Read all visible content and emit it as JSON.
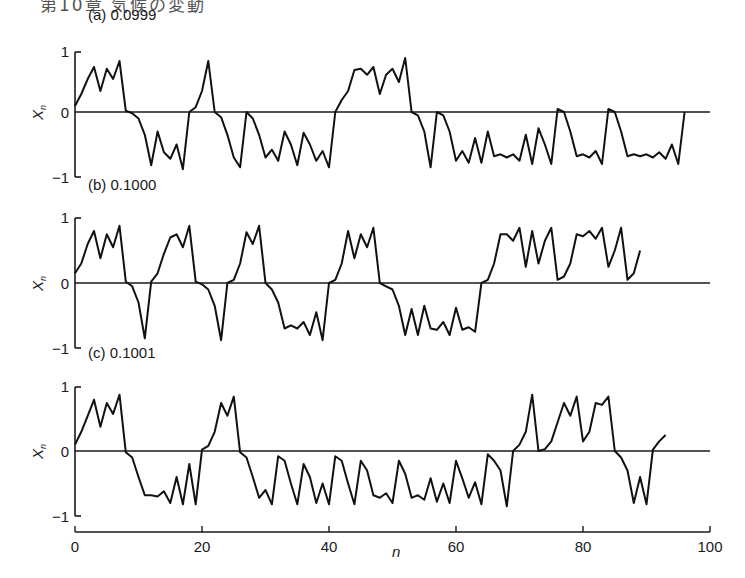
{
  "page_header": "第10章 気候の変動",
  "chart_data": [
    {
      "type": "line",
      "title": "(a) 0.0999",
      "panel_label": "(a)",
      "parameter": "0.0999",
      "xlabel": "n",
      "ylabel": "X_n",
      "xlim": [
        0,
        100
      ],
      "ylim": [
        -1,
        1
      ],
      "yticks": [
        "1",
        "0",
        "−1"
      ],
      "grid": false,
      "zero_line": true,
      "x": [
        0,
        1,
        2,
        3,
        4,
        5,
        6,
        7,
        8,
        9,
        10,
        11,
        12,
        13,
        14,
        15,
        16,
        17,
        18,
        19,
        20,
        21,
        22,
        23,
        24,
        25,
        26,
        27,
        28,
        29,
        30,
        31,
        32,
        33,
        34,
        35,
        36,
        37,
        38,
        39,
        40,
        41,
        42,
        43,
        44,
        45,
        46,
        47,
        48,
        49,
        50,
        51,
        52,
        53,
        54,
        55,
        56,
        57,
        58,
        59,
        60,
        61,
        62,
        63,
        64,
        65,
        66,
        67,
        68,
        69,
        70,
        71,
        72,
        73,
        74,
        75,
        76,
        77,
        78,
        79,
        80,
        81,
        82,
        83,
        84,
        85,
        86,
        87,
        88,
        89,
        90,
        91,
        92,
        93,
        94,
        95,
        96,
        97,
        98,
        99,
        100
      ],
      "values": [
        0.1,
        0.3,
        0.55,
        0.75,
        0.35,
        0.72,
        0.55,
        0.85,
        0.02,
        -0.02,
        -0.1,
        -0.35,
        -0.82,
        -0.3,
        -0.62,
        -0.72,
        -0.5,
        -0.88,
        0.0,
        0.08,
        0.35,
        0.85,
        0.0,
        -0.08,
        -0.35,
        -0.7,
        -0.85,
        0.0,
        -0.1,
        -0.35,
        -0.7,
        -0.58,
        -0.75,
        -0.3,
        -0.5,
        -0.82,
        -0.32,
        -0.5,
        -0.75,
        -0.6,
        -0.85,
        0.0,
        0.2,
        0.35,
        0.7,
        0.72,
        0.62,
        0.75,
        0.3,
        0.62,
        0.72,
        0.5,
        0.9,
        0.0,
        -0.05,
        -0.3,
        -0.85,
        0.0,
        -0.05,
        -0.3,
        -0.75,
        -0.6,
        -0.78,
        -0.4,
        -0.78,
        -0.3,
        -0.68,
        -0.65,
        -0.7,
        -0.65,
        -0.75,
        -0.35,
        -0.8,
        -0.25,
        -0.5,
        -0.8,
        0.05,
        0.0,
        -0.3,
        -0.68,
        -0.65,
        -0.7,
        -0.6,
        -0.8,
        0.05,
        0.0,
        -0.3,
        -0.68,
        -0.65,
        -0.68,
        -0.65,
        -0.7,
        -0.62,
        -0.72,
        -0.5,
        -0.8,
        0.0,
        null,
        null,
        null,
        null
      ]
    },
    {
      "type": "line",
      "title": "(b) 0.1000",
      "panel_label": "(b)",
      "parameter": "0.1000",
      "xlabel": "n",
      "ylabel": "X_n",
      "xlim": [
        0,
        100
      ],
      "ylim": [
        -1,
        1
      ],
      "yticks": [
        "1",
        "0",
        "−1"
      ],
      "grid": false,
      "zero_line": true,
      "x": [
        0,
        1,
        2,
        3,
        4,
        5,
        6,
        7,
        8,
        9,
        10,
        11,
        12,
        13,
        14,
        15,
        16,
        17,
        18,
        19,
        20,
        21,
        22,
        23,
        24,
        25,
        26,
        27,
        28,
        29,
        30,
        31,
        32,
        33,
        34,
        35,
        36,
        37,
        38,
        39,
        40,
        41,
        42,
        43,
        44,
        45,
        46,
        47,
        48,
        49,
        50,
        51,
        52,
        53,
        54,
        55,
        56,
        57,
        58,
        59,
        60,
        61,
        62,
        63,
        64,
        65,
        66,
        67,
        68,
        69,
        70,
        71,
        72,
        73,
        74,
        75,
        76,
        77,
        78,
        79,
        80,
        81,
        82,
        83,
        84,
        85,
        86,
        87,
        88,
        89,
        90,
        91,
        92,
        93,
        94,
        95,
        96,
        97,
        98,
        99,
        100
      ],
      "values": [
        0.15,
        0.3,
        0.6,
        0.8,
        0.38,
        0.75,
        0.55,
        0.88,
        0.02,
        -0.05,
        -0.3,
        -0.85,
        0.02,
        0.15,
        0.45,
        0.7,
        0.75,
        0.55,
        0.88,
        0.02,
        -0.02,
        -0.1,
        -0.35,
        -0.88,
        0.0,
        0.05,
        0.3,
        0.78,
        0.6,
        0.88,
        0.0,
        -0.1,
        -0.3,
        -0.7,
        -0.65,
        -0.7,
        -0.6,
        -0.8,
        -0.45,
        -0.88,
        0.0,
        0.05,
        0.3,
        0.8,
        0.38,
        0.75,
        0.55,
        0.85,
        0.0,
        -0.05,
        -0.1,
        -0.35,
        -0.8,
        -0.4,
        -0.8,
        -0.35,
        -0.7,
        -0.72,
        -0.6,
        -0.8,
        -0.38,
        -0.72,
        -0.68,
        -0.75,
        0.0,
        0.05,
        0.3,
        0.75,
        0.75,
        0.65,
        0.85,
        0.25,
        0.8,
        0.3,
        0.65,
        0.85,
        0.05,
        0.1,
        0.3,
        0.75,
        0.72,
        0.8,
        0.68,
        0.85,
        0.25,
        0.5,
        0.85,
        0.05,
        0.15,
        0.5,
        null,
        null,
        null,
        null,
        null,
        null,
        null,
        null,
        null,
        null,
        null
      ]
    },
    {
      "type": "line",
      "title": "(c) 0.1001",
      "panel_label": "(c)",
      "parameter": "0.1001",
      "xlabel": "n",
      "ylabel": "X_n",
      "xlim": [
        0,
        100
      ],
      "ylim": [
        -1,
        1
      ],
      "xticks": [
        "0",
        "20",
        "40",
        "60",
        "80",
        "100"
      ],
      "yticks": [
        "1",
        "0",
        "−1"
      ],
      "grid": false,
      "zero_line": true,
      "x": [
        0,
        1,
        2,
        3,
        4,
        5,
        6,
        7,
        8,
        9,
        10,
        11,
        12,
        13,
        14,
        15,
        16,
        17,
        18,
        19,
        20,
        21,
        22,
        23,
        24,
        25,
        26,
        27,
        28,
        29,
        30,
        31,
        32,
        33,
        34,
        35,
        36,
        37,
        38,
        39,
        40,
        41,
        42,
        43,
        44,
        45,
        46,
        47,
        48,
        49,
        50,
        51,
        52,
        53,
        54,
        55,
        56,
        57,
        58,
        59,
        60,
        61,
        62,
        63,
        64,
        65,
        66,
        67,
        68,
        69,
        70,
        71,
        72,
        73,
        74,
        75,
        76,
        77,
        78,
        79,
        80,
        81,
        82,
        83,
        84,
        85,
        86,
        87,
        88,
        89,
        90,
        91,
        92,
        93,
        94,
        95,
        96,
        97,
        98,
        99,
        100
      ],
      "values": [
        0.1,
        0.3,
        0.55,
        0.8,
        0.38,
        0.75,
        0.58,
        0.88,
        -0.02,
        -0.1,
        -0.4,
        -0.68,
        -0.68,
        -0.7,
        -0.62,
        -0.8,
        -0.4,
        -0.82,
        -0.2,
        -0.82,
        0.02,
        0.08,
        0.3,
        0.75,
        0.55,
        0.85,
        -0.02,
        -0.1,
        -0.4,
        -0.72,
        -0.6,
        -0.82,
        -0.08,
        -0.15,
        -0.5,
        -0.82,
        -0.2,
        -0.4,
        -0.8,
        -0.5,
        -0.82,
        -0.08,
        -0.15,
        -0.5,
        -0.82,
        -0.15,
        -0.3,
        -0.68,
        -0.72,
        -0.65,
        -0.8,
        -0.15,
        -0.35,
        -0.72,
        -0.68,
        -0.75,
        -0.42,
        -0.78,
        -0.5,
        -0.8,
        -0.15,
        -0.42,
        -0.72,
        -0.48,
        -0.82,
        -0.05,
        -0.15,
        -0.3,
        -0.85,
        0.0,
        0.1,
        0.3,
        0.88,
        0.0,
        0.03,
        0.15,
        0.45,
        0.75,
        0.55,
        0.85,
        0.15,
        0.3,
        0.75,
        0.72,
        0.85,
        0.0,
        -0.1,
        -0.3,
        -0.8,
        -0.4,
        -0.82,
        0.02,
        0.15,
        0.25,
        null,
        null,
        null,
        null,
        null,
        null,
        null
      ]
    }
  ]
}
